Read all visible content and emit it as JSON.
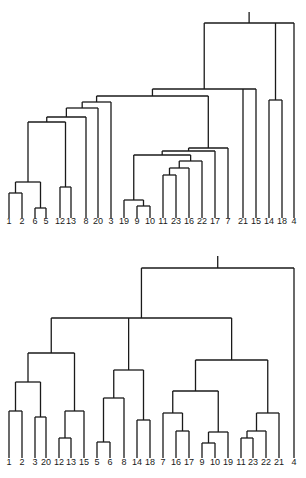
{
  "figures": [
    {
      "id": "top",
      "label_y": 224,
      "leaf_bottom_y": 218,
      "leaves": [
        {
          "label": "1",
          "x": 9
        },
        {
          "label": "2",
          "x": 22
        },
        {
          "label": "6",
          "x": 35
        },
        {
          "label": "5",
          "x": 46
        },
        {
          "label": "12",
          "x": 60
        },
        {
          "label": "13",
          "x": 71
        },
        {
          "label": "8",
          "x": 86
        },
        {
          "label": "20",
          "x": 98
        },
        {
          "label": "3",
          "x": 111
        },
        {
          "label": "19",
          "x": 124
        },
        {
          "label": "9",
          "x": 137
        },
        {
          "label": "10",
          "x": 150
        },
        {
          "label": "11",
          "x": 163
        },
        {
          "label": "23",
          "x": 176
        },
        {
          "label": "16",
          "x": 189
        },
        {
          "label": "22",
          "x": 202
        },
        {
          "label": "17",
          "x": 215
        },
        {
          "label": "7",
          "x": 228
        },
        {
          "label": "21",
          "x": 243
        },
        {
          "label": "15",
          "x": 256
        },
        {
          "label": "14",
          "x": 269
        },
        {
          "label": "18",
          "x": 282
        },
        {
          "label": "4",
          "x": 294
        }
      ],
      "tree": {
        "h": 23,
        "c": [
          {
            "h": 89,
            "c": [
              {
                "h": 96,
                "c": [
                  {
                    "h": 102,
                    "c": [
                      {
                        "h": 108,
                        "c": [
                          {
                            "h": 117,
                            "c": [
                              {
                                "h": 122,
                                "c": [
                                  {
                                    "h": 182,
                                    "c": [
                                      {
                                        "h": 193,
                                        "c": [
                                          {
                                            "l": "1"
                                          },
                                          {
                                            "l": "2"
                                          }
                                        ]
                                      },
                                      {
                                        "h": 188,
                                        "c": [
                                          {
                                            "h": 208,
                                            "c": [
                                              {
                                                "l": "6"
                                              },
                                              {
                                                "l": "5"
                                              }
                                            ]
                                          }
                                        ]
                                      }
                                    ]
                                  },
                                  {
                                    "h": 187,
                                    "c": [
                                      {
                                        "l": "12"
                                      },
                                      {
                                        "l": "13"
                                      }
                                    ]
                                  }
                                ]
                              },
                              {
                                "l": "8"
                              }
                            ]
                          },
                          {
                            "l": "20"
                          }
                        ]
                      },
                      {
                        "l": "3"
                      }
                    ]
                  },
                  {
                    "h": 108,
                    "c": [
                      {
                        "h": 148,
                        "c": [
                          {
                            "h": 151,
                            "c": [
                              {
                                "h": 155,
                                "c": [
                                  {
                                    "h": 200,
                                    "c": [
                                      {
                                        "l": "19"
                                      },
                                      {
                                        "h": 206,
                                        "c": [
                                          {
                                            "l": "9"
                                          },
                                          {
                                            "l": "10"
                                          }
                                        ]
                                      }
                                    ]
                                  },
                                  {
                                    "h": 156,
                                    "c": [
                                      {
                                        "h": 161,
                                        "c": [
                                          {
                                            "h": 168,
                                            "c": [
                                              {
                                                "h": 175,
                                                "c": [
                                                  {
                                                    "l": "11"
                                                  },
                                                  {
                                                    "l": "23"
                                                  }
                                                ]
                                              },
                                              {
                                                "l": "16"
                                              }
                                            ]
                                          },
                                          {
                                            "l": "22"
                                          }
                                        ]
                                      }
                                    ]
                                  }
                                ]
                              },
                              {
                                "l": "17"
                              }
                            ]
                          },
                          {
                            "l": "7"
                          }
                        ]
                      }
                    ]
                  }
                ]
              },
              {
                "l": "21"
              },
              {
                "l": "15"
              }
            ]
          },
          {
            "h": 100,
            "c": [
              {
                "l": "14"
              },
              {
                "l": "18"
              }
            ]
          },
          {
            "l": "4"
          }
        ]
      }
    },
    {
      "id": "bottom",
      "label_y": 226,
      "leaf_bottom_y": 219,
      "leaves": [
        {
          "label": "1",
          "x": 9
        },
        {
          "label": "2",
          "x": 22
        },
        {
          "label": "3",
          "x": 35
        },
        {
          "label": "20",
          "x": 46
        },
        {
          "label": "12",
          "x": 59
        },
        {
          "label": "13",
          "x": 71
        },
        {
          "label": "15",
          "x": 84
        },
        {
          "label": "5",
          "x": 97
        },
        {
          "label": "6",
          "x": 110
        },
        {
          "label": "8",
          "x": 124
        },
        {
          "label": "14",
          "x": 137
        },
        {
          "label": "18",
          "x": 150
        },
        {
          "label": "7",
          "x": 163
        },
        {
          "label": "16",
          "x": 176
        },
        {
          "label": "17",
          "x": 189
        },
        {
          "label": "9",
          "x": 202
        },
        {
          "label": "10",
          "x": 215
        },
        {
          "label": "19",
          "x": 228
        },
        {
          "label": "11",
          "x": 241
        },
        {
          "label": "23",
          "x": 253
        },
        {
          "label": "22",
          "x": 266
        },
        {
          "label": "21",
          "x": 279
        },
        {
          "label": "4",
          "x": 294
        }
      ],
      "tree": {
        "h": 29,
        "c": [
          {
            "h": 79,
            "c": [
              {
                "h": 114,
                "c": [
                  {
                    "h": 143,
                    "c": [
                      {
                        "h": 172,
                        "c": [
                          {
                            "l": "1"
                          },
                          {
                            "l": "2"
                          }
                        ]
                      },
                      {
                        "h": 178,
                        "c": [
                          {
                            "l": "3"
                          },
                          {
                            "l": "20"
                          }
                        ]
                      }
                    ]
                  },
                  {
                    "h": 172,
                    "c": [
                      {
                        "h": 199,
                        "c": [
                          {
                            "l": "12"
                          },
                          {
                            "l": "13"
                          }
                        ]
                      },
                      {
                        "l": "15"
                      }
                    ]
                  }
                ]
              },
              {
                "h": 131,
                "c": [
                  {
                    "h": 159,
                    "c": [
                      {
                        "h": 203,
                        "c": [
                          {
                            "l": "5"
                          },
                          {
                            "l": "6"
                          }
                        ]
                      },
                      {
                        "l": "8"
                      }
                    ]
                  },
                  {
                    "h": 181,
                    "c": [
                      {
                        "l": "14"
                      },
                      {
                        "l": "18"
                      }
                    ]
                  }
                ]
              },
              {
                "h": 121,
                "c": [
                  {
                    "h": 152,
                    "c": [
                      {
                        "h": 174,
                        "c": [
                          {
                            "l": "7"
                          },
                          {
                            "h": 192,
                            "c": [
                              {
                                "l": "16"
                              },
                              {
                                "l": "17"
                              }
                            ]
                          }
                        ]
                      },
                      {
                        "h": 193,
                        "c": [
                          {
                            "h": 204,
                            "c": [
                              {
                                "l": "9"
                              },
                              {
                                "l": "10"
                              }
                            ]
                          },
                          {
                            "l": "19"
                          }
                        ]
                      }
                    ]
                  },
                  {
                    "h": 174,
                    "c": [
                      {
                        "h": 192,
                        "c": [
                          {
                            "h": 199,
                            "c": [
                              {
                                "l": "11"
                              },
                              {
                                "l": "23"
                              }
                            ]
                          },
                          {
                            "l": "22"
                          }
                        ]
                      },
                      {
                        "l": "21"
                      }
                    ]
                  }
                ]
              }
            ]
          },
          {
            "l": "4"
          }
        ]
      }
    }
  ]
}
